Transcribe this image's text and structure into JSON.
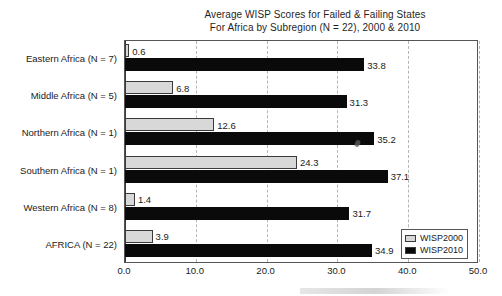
{
  "chart_data": {
    "type": "bar",
    "orientation": "horizontal",
    "title": "Average WISP Scores for Failed & Failing States",
    "subtitle": "For Africa by Subregion (N = 22), 2000 & 2010",
    "xlabel": "",
    "ylabel": "",
    "xlim": [
      0.0,
      50.0
    ],
    "xticks": [
      "0.0",
      "10.0",
      "20.0",
      "30.0",
      "40.0",
      "50.0"
    ],
    "xtick_values": [
      0.0,
      10.0,
      20.0,
      30.0,
      40.0,
      50.0
    ],
    "grid": "vertical-dashed",
    "legend_position": "bottom-right",
    "categories": [
      "Eastern Africa (N = 7)",
      "Middle Africa (N = 5)",
      "Northern Africa (N = 1)",
      "Southern Africa (N = 1)",
      "Western Africa (N = 8)",
      "AFRICA (N = 22)"
    ],
    "series": [
      {
        "name": "WISP2000",
        "color": "#d8d8d8",
        "values": [
          0.6,
          6.8,
          12.6,
          24.3,
          1.4,
          3.9
        ],
        "labels": [
          "0.6",
          "6.8",
          "12.6",
          "24.3",
          "1.4",
          "3.9"
        ]
      },
      {
        "name": "WISP2010",
        "color": "#0a0a0a",
        "values": [
          33.8,
          31.3,
          35.2,
          37.1,
          31.7,
          34.9
        ],
        "labels": [
          "33.8",
          "31.3",
          "35.2",
          "37.1",
          "31.7",
          "34.9"
        ]
      }
    ]
  },
  "legend": {
    "items": [
      {
        "label": "WISP2000"
      },
      {
        "label": "WISP2010"
      }
    ]
  }
}
